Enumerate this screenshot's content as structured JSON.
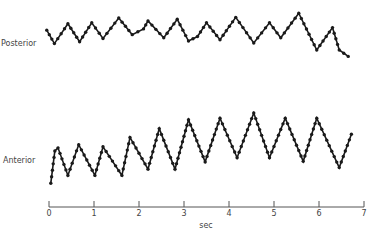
{
  "chart_data": {
    "type": "line",
    "title": "",
    "xlabel": "sec",
    "ylabel": "",
    "xlim": [
      0,
      7
    ],
    "x_ticks": [
      "0",
      "1",
      "2",
      "3",
      "4",
      "5",
      "6",
      "7"
    ],
    "grid": false,
    "series": [
      {
        "name": "Posterior",
        "color": "#1a1a1a",
        "points": [
          [
            -0.05,
            0.62
          ],
          [
            0.12,
            0.2
          ],
          [
            0.42,
            0.82
          ],
          [
            0.68,
            0.26
          ],
          [
            0.95,
            0.85
          ],
          [
            1.2,
            0.36
          ],
          [
            1.55,
            1.0
          ],
          [
            1.85,
            0.48
          ],
          [
            2.1,
            0.66
          ],
          [
            2.2,
            0.91
          ],
          [
            2.55,
            0.38
          ],
          [
            2.85,
            0.96
          ],
          [
            3.1,
            0.28
          ],
          [
            3.3,
            0.42
          ],
          [
            3.5,
            0.85
          ],
          [
            3.8,
            0.32
          ],
          [
            4.15,
            1.02
          ],
          [
            4.55,
            0.22
          ],
          [
            4.9,
            0.85
          ],
          [
            5.15,
            0.38
          ],
          [
            5.55,
            1.15
          ],
          [
            5.95,
            0.0
          ],
          [
            6.3,
            0.7
          ],
          [
            6.45,
            0.0
          ],
          [
            6.65,
            -0.2
          ]
        ]
      },
      {
        "name": "Anterior",
        "color": "#1a1a1a",
        "points": [
          [
            0.04,
            -0.1
          ],
          [
            0.13,
            0.52
          ],
          [
            0.2,
            0.58
          ],
          [
            0.42,
            0.05
          ],
          [
            0.66,
            0.64
          ],
          [
            1.02,
            0.05
          ],
          [
            1.2,
            0.6
          ],
          [
            1.62,
            0.05
          ],
          [
            1.8,
            0.78
          ],
          [
            2.2,
            0.17
          ],
          [
            2.45,
            0.95
          ],
          [
            2.8,
            0.17
          ],
          [
            3.1,
            1.12
          ],
          [
            3.47,
            0.31
          ],
          [
            3.8,
            1.15
          ],
          [
            4.18,
            0.39
          ],
          [
            4.55,
            1.25
          ],
          [
            4.9,
            0.39
          ],
          [
            5.25,
            1.15
          ],
          [
            5.65,
            0.32
          ],
          [
            5.95,
            1.15
          ],
          [
            6.45,
            0.2
          ],
          [
            6.72,
            0.84
          ]
        ]
      }
    ]
  }
}
